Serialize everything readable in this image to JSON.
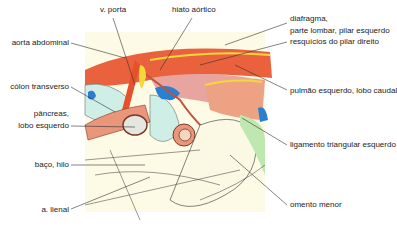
{
  "diagram": {
    "type": "anatomical-illustration",
    "labels_left": [
      {
        "id": "aorta",
        "text": "aorta abdominal"
      },
      {
        "id": "colon",
        "text": "cólon transverso"
      },
      {
        "id": "pancreas_1",
        "text": "pâncreas,"
      },
      {
        "id": "pancreas_2",
        "text": "lobo esquerdo"
      },
      {
        "id": "baco",
        "text": "baço, hilo"
      },
      {
        "id": "lienal",
        "text": "a. lienal"
      }
    ],
    "labels_top": [
      {
        "id": "porta",
        "text": "v. porta"
      },
      {
        "id": "hiato",
        "text": "hiato aórtico"
      }
    ],
    "labels_right": [
      {
        "id": "diafragma_1",
        "text": "diafragma,"
      },
      {
        "id": "diafragma_2",
        "text": "parte lombar, pilar esquerdo"
      },
      {
        "id": "resquicios",
        "text": "resquícios do pilar direito"
      },
      {
        "id": "pulmao",
        "text": "pulmão esquerdo, lobo caudal"
      },
      {
        "id": "ligamento",
        "text": "ligamento triangular esquerdo"
      },
      {
        "id": "omento",
        "text": "omento menor"
      }
    ],
    "colors": {
      "background": "#fdfbe6",
      "artery": "#e8502a",
      "vein": "#2b7fd0",
      "muscle": "#e89a8c",
      "pancreas": "#e9967a",
      "colon": "#cfeee6",
      "ligament": "#bfe7b0",
      "yellow": "#f4d83a"
    }
  }
}
